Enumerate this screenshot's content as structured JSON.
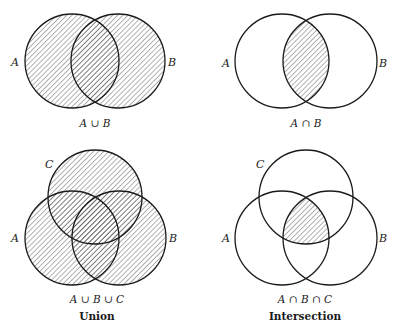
{
  "figures": {
    "union_two": {
      "expression": "A ∪ B",
      "labels": {
        "a": "A",
        "b": "B"
      },
      "shaded_region": "union"
    },
    "intersection_two": {
      "expression": "A ∩ B",
      "labels": {
        "a": "A",
        "b": "B"
      },
      "shaded_region": "intersection"
    },
    "union_three": {
      "expression": "A ∪ B ∪ C",
      "labels": {
        "a": "A",
        "b": "B",
        "c": "C"
      },
      "shaded_region": "union"
    },
    "intersection_three": {
      "expression": "A ∩ B ∩ C",
      "labels": {
        "a": "A",
        "b": "B",
        "c": "C"
      },
      "shaded_region": "intersection"
    }
  },
  "captions": {
    "left_column": "Union",
    "right_column": "Intersection"
  },
  "colors": {
    "stroke": "#1a1a1a",
    "hatch": "#555555",
    "background": "#ffffff"
  }
}
